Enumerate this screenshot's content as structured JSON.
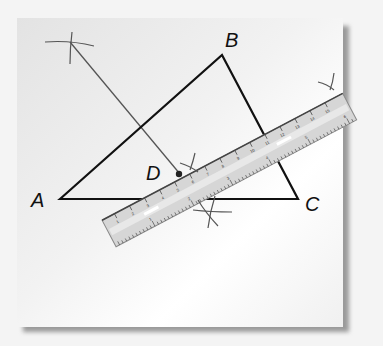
{
  "figure": {
    "points": {
      "A": {
        "label": "A",
        "x": 60,
        "y": 199
      },
      "B": {
        "label": "B",
        "x": 222,
        "y": 55
      },
      "C": {
        "label": "C",
        "x": 298,
        "y": 199
      },
      "D": {
        "label": "D",
        "x": 178,
        "y": 174
      }
    },
    "label_positions": {
      "A": {
        "x": 31,
        "y": 207
      },
      "B": {
        "x": 225,
        "y": 47
      },
      "C": {
        "x": 305,
        "y": 211
      },
      "D": {
        "x": 146,
        "y": 180
      }
    },
    "construction_arcs": [
      "upper-left arc intersection",
      "arc near D",
      "arc below ruler",
      "arc at upper-right of ruler"
    ],
    "ruler": {
      "top_numbers": [
        "1",
        "2",
        "3",
        "4",
        "5",
        "6",
        "7",
        "8",
        "9",
        "10",
        "11",
        "12",
        "13",
        "14",
        "15"
      ],
      "bottom_numbers": [
        "1",
        "2",
        "3",
        "4",
        "5",
        "6"
      ]
    },
    "colors": {
      "triangle_stroke": "#111111",
      "construction_stroke": "#555555",
      "ruler_fill": "#d8d8d8",
      "ruler_edge": "#8a8a8a"
    }
  }
}
